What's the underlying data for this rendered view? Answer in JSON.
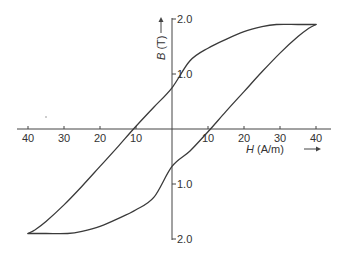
{
  "chart_data": {
    "type": "line",
    "title": "",
    "xlabel": "H (A/m)",
    "ylabel": "B (T)",
    "xlabel_var": "H",
    "xlabel_unit": "(A/m)",
    "ylabel_var": "B",
    "ylabel_unit": "(T)",
    "xlim": [
      -40,
      40
    ],
    "ylim": [
      -2.0,
      2.0
    ],
    "x_ticks": [
      -40,
      -30,
      -20,
      -10,
      10,
      20,
      30,
      40
    ],
    "x_tick_labels": [
      "40",
      "30",
      "20",
      "10",
      "10",
      "20",
      "30",
      "40"
    ],
    "y_ticks": [
      2.0,
      1.0,
      -1.0,
      -2.0
    ],
    "y_tick_labels": [
      "2.0",
      "1.0",
      "1.0",
      "2.0"
    ],
    "grid": false,
    "legend": null,
    "series": [
      {
        "name": "descending branch (upper)",
        "x": [
          40,
          35,
          29,
          25,
          20,
          15,
          10,
          5,
          0,
          -5,
          -10,
          -15,
          -20,
          -25,
          -30,
          -35,
          -38,
          -40
        ],
        "y": [
          1.9,
          1.9,
          1.9,
          1.86,
          1.77,
          1.63,
          1.47,
          1.24,
          0.75,
          0.4,
          0.05,
          -0.32,
          -0.68,
          -1.04,
          -1.38,
          -1.68,
          -1.83,
          -1.9
        ]
      },
      {
        "name": "ascending branch (lower)",
        "x": [
          -40,
          -35,
          -29,
          -25,
          -20,
          -15,
          -10,
          -5,
          0,
          5,
          10,
          15,
          20,
          25,
          30,
          35,
          38,
          40
        ],
        "y": [
          -1.9,
          -1.9,
          -1.9,
          -1.86,
          -1.77,
          -1.63,
          -1.47,
          -1.24,
          -0.68,
          -0.4,
          -0.05,
          0.32,
          0.68,
          1.04,
          1.38,
          1.68,
          1.83,
          1.9
        ]
      }
    ],
    "annotations": {
      "coercivity_A_per_m": 10,
      "remanence_T": 0.75,
      "saturation_T": 1.9
    }
  },
  "labels": {
    "h_axis_var": "H",
    "h_axis_unit": " (A/m)",
    "b_axis_var": "B",
    "b_axis_unit": " (T)",
    "arrow": "→"
  },
  "colors": {
    "line": "#3a3a3a",
    "axis": "#444444",
    "text": "#333333",
    "background": "#ffffff"
  }
}
